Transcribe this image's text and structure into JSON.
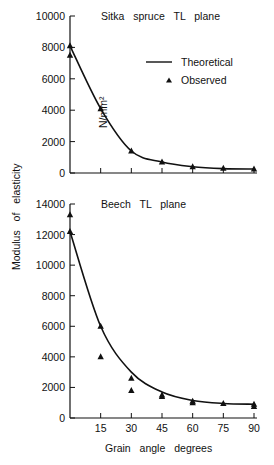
{
  "y_axis_label": "Modulus  of  elasticity",
  "y_axis_unit": "N/mm²",
  "x_axis_label": "Grain   angle   degrees",
  "legend": {
    "theoretical": "Theoretical",
    "observed": "Observed"
  },
  "chart_data": [
    {
      "type": "line",
      "title": "Sitka spruce TL plane",
      "xlabel": "Grain angle degrees",
      "ylabel": "Modulus of elasticity N/mm²",
      "xlim": [
        0,
        90
      ],
      "ylim": [
        0,
        10000
      ],
      "y_ticks": [
        0,
        2000,
        4000,
        6000,
        8000,
        10000
      ],
      "x_ticks": [
        0,
        15,
        30,
        45,
        60,
        75,
        90
      ],
      "grid": false,
      "legend_position": "upper right",
      "series": [
        {
          "name": "Theoretical",
          "style": "line",
          "x": [
            0,
            15,
            30,
            45,
            60,
            75,
            90
          ],
          "y": [
            8100,
            4100,
            1400,
            700,
            400,
            280,
            250
          ]
        },
        {
          "name": "Observed",
          "style": "triangle-markers",
          "points": [
            [
              0,
              8100
            ],
            [
              0,
              7500
            ],
            [
              15,
              4100
            ],
            [
              30,
              1400
            ],
            [
              45,
              700
            ],
            [
              60,
              400
            ],
            [
              75,
              300
            ],
            [
              90,
              250
            ]
          ]
        }
      ]
    },
    {
      "type": "line",
      "title": "Beech TL plane",
      "xlabel": "Grain angle degrees",
      "ylabel": "Modulus of elasticity N/mm²",
      "xlim": [
        0,
        90
      ],
      "ylim": [
        0,
        14000
      ],
      "y_ticks": [
        0,
        2000,
        4000,
        6000,
        8000,
        10000,
        12000,
        14000
      ],
      "x_ticks": [
        0,
        15,
        30,
        45,
        60,
        75,
        90
      ],
      "x_tick_labels": [
        "0",
        "15",
        "30",
        "45",
        "60",
        "75",
        "90"
      ],
      "grid": false,
      "series": [
        {
          "name": "Theoretical",
          "style": "line",
          "x": [
            0,
            15,
            30,
            45,
            60,
            75,
            90
          ],
          "y": [
            12200,
            6000,
            3000,
            1700,
            1150,
            950,
            900
          ]
        },
        {
          "name": "Observed",
          "style": "triangle-markers",
          "points": [
            [
              0,
              13300
            ],
            [
              0,
              12200
            ],
            [
              15,
              6000
            ],
            [
              15,
              4000
            ],
            [
              30,
              2600
            ],
            [
              30,
              1800
            ],
            [
              45,
              1500
            ],
            [
              45,
              1400
            ],
            [
              60,
              1100
            ],
            [
              60,
              1000
            ],
            [
              75,
              950
            ],
            [
              90,
              900
            ],
            [
              90,
              750
            ]
          ]
        }
      ]
    }
  ]
}
